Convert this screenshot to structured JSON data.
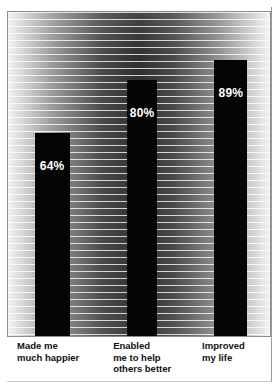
{
  "chart_data": {
    "type": "bar",
    "title": "",
    "subtitle": "",
    "xlabel": "",
    "ylabel": "",
    "ylim": [
      0,
      100
    ],
    "grid": true,
    "grid_orientation": "horizontal",
    "legend": "none",
    "categories": [
      "Made me\nmuch happier",
      "Enabled\nme to help\nothers better",
      "Improved\nmy life"
    ],
    "values": [
      64,
      80,
      89
    ],
    "value_labels": [
      "64%",
      "80%",
      "89%"
    ],
    "bar_color": "#050505",
    "value_label_color": "#ffffff",
    "background": "striped-gradient"
  },
  "bars": [
    {
      "label": "Made me\nmuch happier",
      "value": 64,
      "value_label": "64%",
      "left_pct": 10.2,
      "width_pct": 13.3,
      "height_pct": 62.6,
      "label_left_pct": 3.8
    },
    {
      "label": "Enabled\nme to help\nothers better",
      "value": 80,
      "value_label": "80%",
      "left_pct": 45.5,
      "width_pct": 11.4,
      "height_pct": 79.1,
      "label_left_pct": 40.2
    },
    {
      "label": "Improved\nmy life",
      "value": 89,
      "value_label": "89%",
      "left_pct": 78.8,
      "width_pct": 12.5,
      "height_pct": 85.3,
      "label_left_pct": 73.9
    }
  ]
}
